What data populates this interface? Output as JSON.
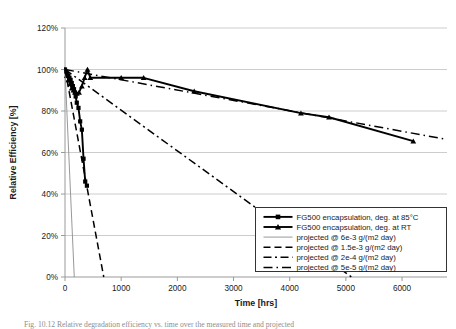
{
  "figure": {
    "caption": "Fig. 10.12   Relative degradation efficiency vs. time over the measured time and projected"
  },
  "chart_data": {
    "type": "line",
    "title": "",
    "xlabel": "Time [hrs]",
    "ylabel": "Relative Efficiency [%]",
    "xlim": [
      0,
      6800
    ],
    "ylim": [
      0,
      120
    ],
    "xticks": [
      0,
      1000,
      2000,
      3000,
      4000,
      5000,
      6000
    ],
    "xtick_labels": [
      "0",
      "1000",
      "2000",
      "3000",
      "4000",
      "5000",
      "6000"
    ],
    "yticks": [
      0,
      20,
      40,
      60,
      80,
      100,
      120
    ],
    "ytick_labels": [
      "0%",
      "20%",
      "40%",
      "60%",
      "80%",
      "100%",
      "120%"
    ],
    "grid": "horizontal",
    "legend_position": "bottom-right",
    "series": [
      {
        "name": "FG500 encapsulation, deg. at 85°C",
        "style": "solid-marker-square",
        "marker": "square",
        "color": "#000000",
        "x": [
          0,
          20,
          40,
          60,
          80,
          100,
          120,
          140,
          160,
          175,
          190,
          210,
          240,
          270,
          300,
          330,
          360,
          390
        ],
        "y": [
          100,
          99,
          98,
          97,
          96,
          95,
          93.5,
          92,
          90.5,
          89,
          87,
          84,
          81.5,
          75,
          71,
          57,
          46,
          44
        ]
      },
      {
        "name": "FG500 encapsulation, deg. at RT",
        "style": "solid-marker-triangle",
        "marker": "triangle",
        "color": "#000000",
        "x": [
          0,
          30,
          60,
          90,
          120,
          150,
          180,
          210,
          250,
          300,
          350,
          400,
          450,
          1000,
          1400,
          2300,
          4200,
          4700,
          6200
        ],
        "y": [
          100,
          97,
          95,
          93,
          91,
          90,
          89,
          88.5,
          89,
          92,
          96,
          100,
          96,
          96,
          96,
          89.5,
          79,
          77,
          65.5
        ]
      },
      {
        "name": "projected @ 6e-3 g/(m2 day)",
        "style": "thin-solid",
        "marker": "none",
        "color": "#808080",
        "x": [
          0,
          165
        ],
        "y": [
          100,
          0
        ]
      },
      {
        "name": "projected @ 1.5e-3 g/(m2 day)",
        "style": "dashed",
        "marker": "none",
        "color": "#000000",
        "x": [
          0,
          690
        ],
        "y": [
          100,
          0
        ]
      },
      {
        "name": "projected @ 2e-4 g/(m2 day)",
        "style": "dash-dot",
        "marker": "none",
        "color": "#000000",
        "x": [
          0,
          5100
        ],
        "y": [
          100,
          0
        ]
      },
      {
        "name": "projected @ 5e-5 g/(m2 day)",
        "style": "long-dash-dot",
        "marker": "none",
        "color": "#000000",
        "x": [
          0,
          6750
        ],
        "y": [
          100,
          66.5
        ]
      }
    ],
    "legend": [
      {
        "label": "FG500 encapsulation, deg. at 85°C",
        "style": "solid-marker-square"
      },
      {
        "label": "FG500 encapsulation, deg. at RT",
        "style": "solid-marker-triangle"
      },
      {
        "label": "projected @ 6e-3 g/(m2 day)",
        "style": "thin-solid"
      },
      {
        "label": "projected @ 1.5e-3 g/(m2 day)",
        "style": "dashed"
      },
      {
        "label": "projected @ 2e-4 g/(m2 day)",
        "style": "dash-dot"
      },
      {
        "label": "projected @ 5e-5 g/(m2 day)",
        "style": "long-dash-dot"
      }
    ],
    "colors": {
      "axis": "#9a9a9a",
      "grid": "#b8b8b8",
      "data": "#000000",
      "thin_line": "#8c8c8c",
      "text": "#1a1a1a"
    }
  }
}
